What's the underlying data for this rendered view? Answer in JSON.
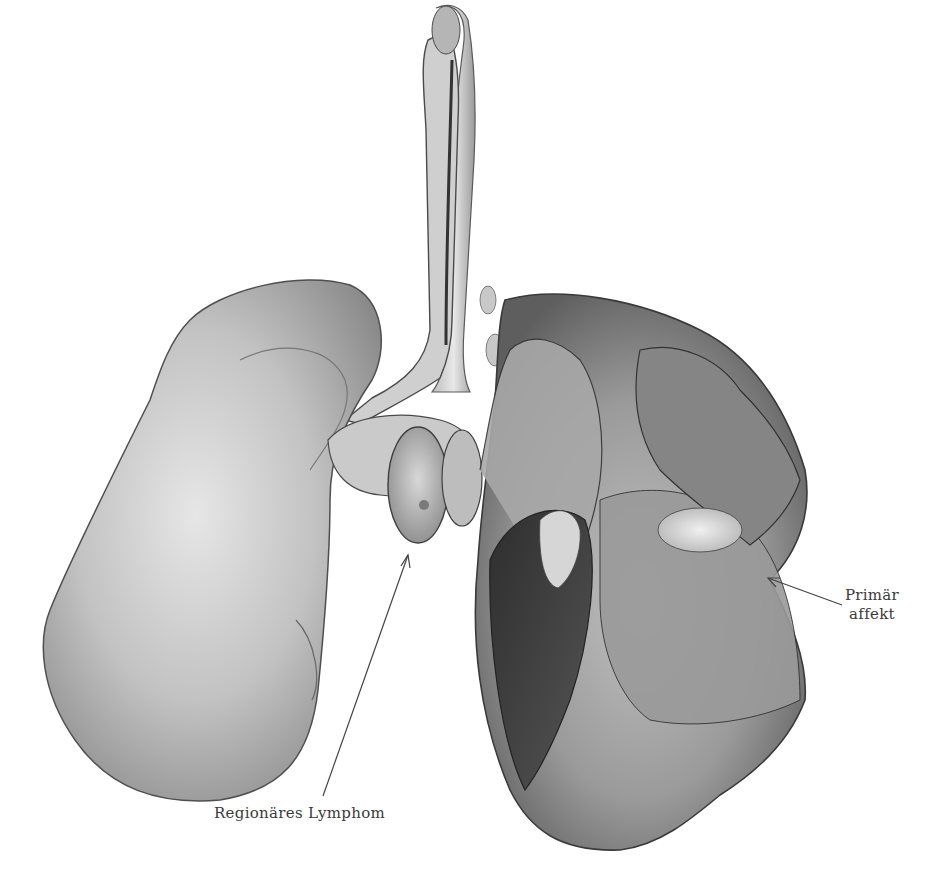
{
  "figure": {
    "style": "grayscale-anatomical-engraving",
    "colors": {
      "background": "#ffffff",
      "tissue_light": "#d8d8d8",
      "tissue_mid": "#a8a8a8",
      "tissue_dark": "#555555",
      "label_text": "#3a3a3a",
      "pointer_line": "#444444"
    }
  },
  "labels": {
    "regional_lymphoma": "Regionäres Lymphom",
    "primary_affect_line1": "Primär",
    "primary_affect_line2": "affekt"
  }
}
